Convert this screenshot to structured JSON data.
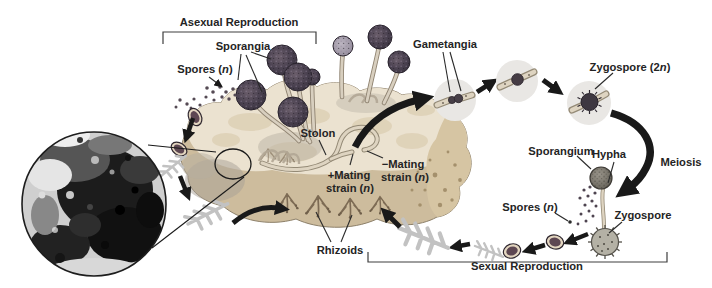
{
  "labels": {
    "asexual": "Asexual Reproduction",
    "sporangia": "Sporangia",
    "spores_top": {
      "pre": "Spores (",
      "it": "n",
      "post": ")"
    },
    "gametangia": "Gametangia",
    "zygospore2n": {
      "pre": "Zygospore (2",
      "it": "n",
      "post": ")"
    },
    "stolon": "Stolon",
    "mating_plus": {
      "line1": "+Mating",
      "line2": {
        "pre": "strain (",
        "it": "n",
        "post": ")"
      }
    },
    "mating_minus": {
      "line1": "−Mating",
      "line2": {
        "pre": "strain (",
        "it": "n",
        "post": ")"
      }
    },
    "rhizoids": "Rhizoids",
    "sporangium": "Sporangium",
    "hypha": "Hypha",
    "meiosis": "Meiosis",
    "zygospore": "Zygospore",
    "spores_bottom": {
      "pre": "Spores (",
      "it": "n",
      "post": ")"
    },
    "sexual": "Sexual Reproduction"
  },
  "colors": {
    "background": "#ffffff",
    "bread_top": "#ebe2d0",
    "bread_crust": "#cdbc9d",
    "sporangium_dark": "#453d47",
    "stage_circle": "#e9e7e4",
    "arrow_black": "#191919",
    "feather_gray": "#c2c2c2",
    "rhizoid_brown": "#7d6b54",
    "label_text": "#242424"
  }
}
